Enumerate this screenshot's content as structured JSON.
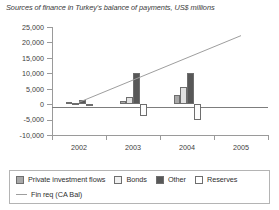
{
  "chart_data": {
    "type": "bar",
    "title": "Sources of finance in Turkey's balance of payments, US$ millions",
    "xlabel": "",
    "ylabel": "",
    "ylim": [
      -10000,
      25000
    ],
    "yticks": [
      25000,
      20000,
      15000,
      10000,
      5000,
      0,
      -5000,
      -10000
    ],
    "ytick_labels": [
      "25,000",
      "20,000",
      "15,000",
      "10,000",
      "5,000",
      "0",
      "-5,000",
      "-10,000"
    ],
    "categories": [
      "2002",
      "2003",
      "2004",
      "2005"
    ],
    "grid": false,
    "legend_position": "bottom",
    "series": [
      {
        "name": "Private investment flows",
        "color": "#a8a8a8",
        "values": [
          700,
          1100,
          3000,
          0
        ]
      },
      {
        "name": "Bonds",
        "color": "#e2e2e2",
        "values": [
          300,
          2400,
          5500,
          0
        ]
      },
      {
        "name": "Other",
        "color": "#585858",
        "values": [
          1300,
          10200,
          10000,
          0
        ]
      },
      {
        "name": "Reserves",
        "color": "#fdfdfd",
        "values": [
          -200,
          -4000,
          -5000,
          0
        ]
      }
    ],
    "line_series": {
      "name": "Fin req (CA Bal)",
      "color": "#9e9e9e",
      "x": [
        "2002",
        "2003",
        "2004",
        "2005"
      ],
      "values": [
        600,
        7800,
        15000,
        22200
      ]
    }
  },
  "legend": {
    "entries": [
      {
        "label": "Private investment flows",
        "marker": "swatch-private"
      },
      {
        "label": "Bonds",
        "marker": "swatch-bonds"
      },
      {
        "label": "Other",
        "marker": "swatch-other"
      },
      {
        "label": "Reserves",
        "marker": "swatch-reserves"
      },
      {
        "label": "Fin req (CA Bal)",
        "marker": "line-marker"
      }
    ]
  }
}
